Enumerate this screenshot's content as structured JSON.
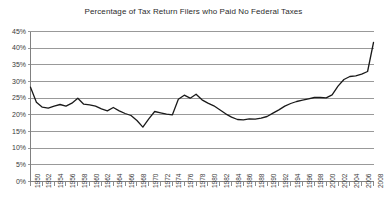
{
  "chart_data": {
    "type": "line",
    "title": "Percentage of Tax Return Filers who Paid No Federal Taxes",
    "xlabel": "",
    "ylabel": "",
    "ylim": [
      0,
      45
    ],
    "ytick_step": 5,
    "ytick_labels": [
      "0%",
      "5%",
      "10%",
      "15%",
      "20%",
      "25%",
      "30%",
      "35%",
      "40%",
      "45%"
    ],
    "ytick_values": [
      0,
      5,
      10,
      15,
      20,
      25,
      30,
      35,
      40,
      45
    ],
    "xlim": [
      1950,
      2008
    ],
    "xtick_step": 2,
    "grid": "horizontal",
    "legend": "none",
    "series_color": "#1a1a1a",
    "xtick_labels": [
      "1950",
      "1952",
      "1954",
      "1956",
      "1958",
      "1960",
      "1962",
      "1964",
      "1966",
      "1968",
      "1970",
      "1972",
      "1974",
      "1976",
      "1978",
      "1980",
      "1982",
      "1984",
      "1986",
      "1988",
      "1990",
      "1992",
      "1994",
      "1996",
      "1998",
      "2000",
      "2002",
      "2004",
      "2006",
      "2008"
    ],
    "x": [
      1950,
      1951,
      1952,
      1953,
      1954,
      1955,
      1956,
      1957,
      1958,
      1959,
      1960,
      1961,
      1962,
      1963,
      1964,
      1965,
      1966,
      1967,
      1968,
      1969,
      1970,
      1971,
      1972,
      1973,
      1974,
      1975,
      1976,
      1977,
      1978,
      1979,
      1980,
      1981,
      1982,
      1983,
      1984,
      1985,
      1986,
      1987,
      1988,
      1989,
      1990,
      1991,
      1992,
      1993,
      1994,
      1995,
      1996,
      1997,
      1998,
      1999,
      2000,
      2001,
      2002,
      2003,
      2004,
      2005,
      2006,
      2007,
      2008
    ],
    "series": [
      {
        "name": "Percentage of tax return filers who paid no federal taxes",
        "values": [
          28.3,
          23.8,
          22.3,
          22.0,
          22.6,
          23.1,
          22.6,
          23.5,
          25.0,
          23.2,
          23.0,
          22.6,
          21.8,
          21.2,
          22.2,
          21.2,
          20.4,
          19.8,
          18.3,
          16.3,
          18.8,
          21.0,
          20.6,
          20.2,
          20.0,
          24.7,
          25.9,
          25.0,
          26.2,
          24.5,
          23.5,
          22.7,
          21.5,
          20.3,
          19.3,
          18.6,
          18.5,
          18.8,
          18.7,
          19.0,
          19.5,
          20.5,
          21.5,
          22.6,
          23.4,
          24.0,
          24.4,
          24.8,
          25.2,
          25.2,
          25.1,
          26.0,
          28.6,
          30.6,
          31.5,
          31.7,
          32.2,
          33.0,
          41.7
        ]
      }
    ]
  }
}
